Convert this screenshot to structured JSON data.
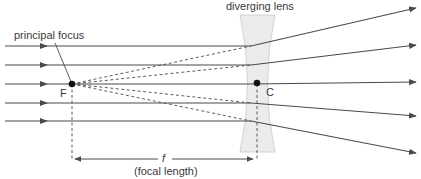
{
  "diagram": {
    "labels": {
      "lens": "diverging lens",
      "principal_focus": "principal focus",
      "focus_point": "F",
      "center_point": "C",
      "focal_symbol": "f",
      "focal_length": "(focal length)"
    },
    "colors": {
      "ray": "#4a4a4a",
      "lens_fill": "#ebebeb",
      "lens_stroke": "#c8c8c8",
      "text": "#3a3a3a"
    },
    "points": {
      "F": {
        "x": 72,
        "y": 84
      },
      "C": {
        "x": 257,
        "y": 84
      }
    },
    "rays": [
      {
        "incident_y": 46,
        "lens_x": 251,
        "exit_y": 8
      },
      {
        "incident_y": 65,
        "lens_x": 251,
        "exit_y": 45
      },
      {
        "incident_y": 84,
        "lens_x": 251,
        "exit_y": 82
      },
      {
        "incident_y": 103,
        "lens_x": 251,
        "exit_y": 116
      },
      {
        "incident_y": 121,
        "lens_x": 251,
        "exit_y": 153
      }
    ]
  }
}
